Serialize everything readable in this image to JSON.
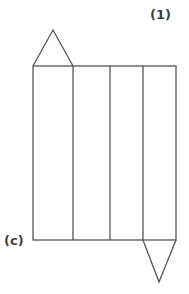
{
  "labels": {
    "problem_number": "(1)",
    "option_letter": "(c)"
  },
  "diagram": {
    "rectangle": {
      "x": 33,
      "y": 66,
      "width": 143,
      "height": 174
    },
    "dividers_x": [
      73,
      110,
      143
    ],
    "top_triangle": {
      "base": [
        [
          33,
          66
        ],
        [
          73,
          66
        ]
      ],
      "apex": [
        53,
        30
      ]
    },
    "bottom_triangle": {
      "base": [
        [
          143,
          240
        ],
        [
          176,
          240
        ]
      ],
      "apex": [
        159,
        282
      ]
    },
    "stroke_color": "#555555"
  }
}
